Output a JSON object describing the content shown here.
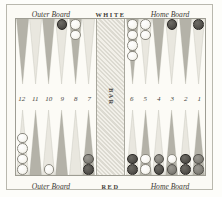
{
  "figure": {
    "kind": "backgammon-board-diagram",
    "colors": {
      "page_background": "#fdfdfa",
      "field_background": "#fcfbf6",
      "frame_line": "#b9b8ae",
      "point_dark": "#b4b2a8",
      "point_light": "#e9e7df",
      "checker_dark": "#55534e",
      "checker_light": "#f7f6f1",
      "bar_fill": "#e6e4dc",
      "text": "#3d3b36"
    }
  },
  "labels": {
    "top": {
      "left": "Outer Board",
      "center": "WHITE",
      "right": "Home Board"
    },
    "bottom": {
      "left": "Outer Board",
      "center": "RED",
      "right": "Home Board"
    },
    "bar": "BAR"
  },
  "point_numbers": [
    "12",
    "11",
    "10",
    "9",
    "8",
    "7",
    "6",
    "5",
    "4",
    "3",
    "2",
    "1"
  ],
  "points": {
    "top_left": [
      {
        "number": "12",
        "checkers": []
      },
      {
        "number": "11",
        "checkers": []
      },
      {
        "number": "10",
        "checkers": []
      },
      {
        "number": "9",
        "checkers": [
          "dark"
        ]
      },
      {
        "number": "8",
        "checkers": [
          "light",
          "light"
        ]
      },
      {
        "number": "7",
        "checkers": []
      }
    ],
    "top_right": [
      {
        "number": "6",
        "checkers": [
          "light",
          "light",
          "light",
          "light"
        ]
      },
      {
        "number": "5",
        "checkers": [
          "light",
          "light"
        ]
      },
      {
        "number": "4",
        "checkers": []
      },
      {
        "number": "3",
        "checkers": [
          "dark"
        ]
      },
      {
        "number": "2",
        "checkers": []
      },
      {
        "number": "1",
        "checkers": [
          "dark"
        ]
      }
    ],
    "bottom_left": [
      {
        "number": "12",
        "checkers": [
          "light",
          "light",
          "light",
          "light"
        ]
      },
      {
        "number": "11",
        "checkers": []
      },
      {
        "number": "10",
        "checkers": [
          "light"
        ]
      },
      {
        "number": "9",
        "checkers": []
      },
      {
        "number": "8",
        "checkers": []
      },
      {
        "number": "7",
        "checkers": [
          "dark",
          "mid"
        ]
      }
    ],
    "bottom_right": [
      {
        "number": "6",
        "checkers": [
          "dark",
          "dark"
        ]
      },
      {
        "number": "5",
        "checkers": [
          "light",
          "light"
        ]
      },
      {
        "number": "4",
        "checkers": [
          "dark",
          "mid"
        ]
      },
      {
        "number": "3",
        "checkers": [
          "mid",
          "light"
        ]
      },
      {
        "number": "2",
        "checkers": [
          "dark",
          "dark"
        ]
      },
      {
        "number": "1",
        "checkers": [
          "mid",
          "mid"
        ]
      }
    ]
  }
}
